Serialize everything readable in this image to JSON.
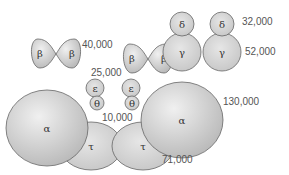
{
  "diagram": {
    "subunits": {
      "alpha": {
        "symbol": "α",
        "mass_label": "130,000"
      },
      "beta": {
        "symbol": "β",
        "mass_label": "40,000"
      },
      "gamma": {
        "symbol": "γ",
        "mass_label": "52,000"
      },
      "delta": {
        "symbol": "δ",
        "mass_label": "32,000"
      },
      "epsilon": {
        "symbol": "ε",
        "mass_label": "25,000"
      },
      "theta": {
        "symbol": "θ",
        "mass_label": "10,000"
      },
      "tau": {
        "symbol": "τ",
        "mass_label": "71,000"
      }
    },
    "colors": {
      "fill_light": "#d9d9d9",
      "fill_dark": "#bdbdbd",
      "stroke": "#555555",
      "label": "#555555"
    }
  }
}
